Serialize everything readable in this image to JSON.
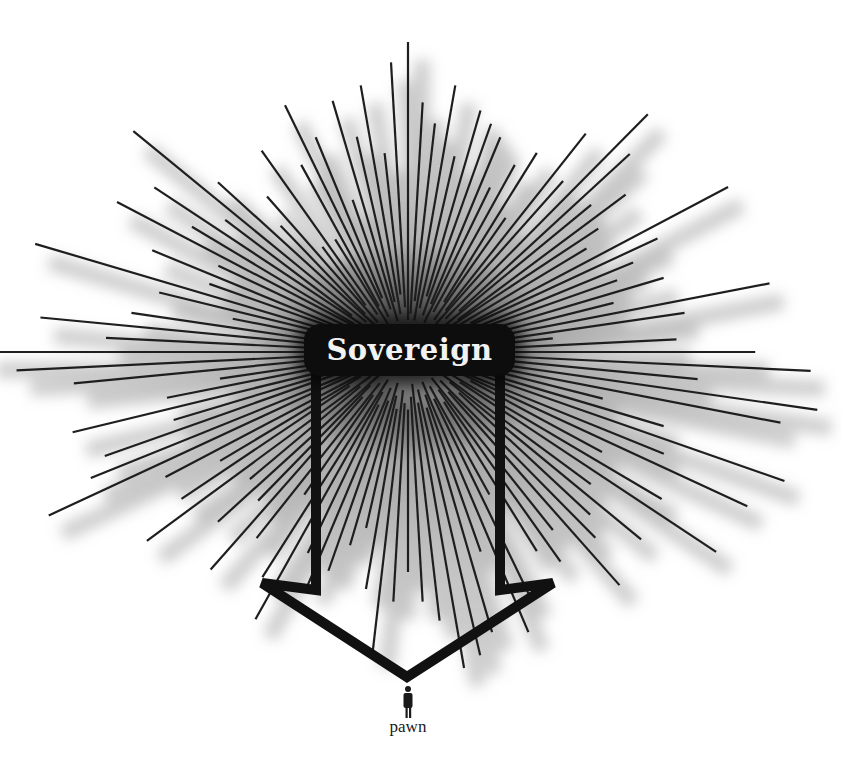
{
  "diagram": {
    "center": {
      "x": 408,
      "y": 352
    },
    "sovereign_label": "Sovereign",
    "pawn_label": "pawn",
    "colors": {
      "background": "#ffffff",
      "ray": "#1e1e1e",
      "ray_shadow": "#9a9a9a",
      "box": "#0d0d0d",
      "box_text": "#f2f2f2",
      "arrow": "#111111",
      "pawn": "#1a1a1a"
    },
    "arrow_path": [
      [
        316,
        372
      ],
      [
        316,
        590
      ],
      [
        262,
        583
      ],
      [
        407,
        677
      ],
      [
        553,
        583
      ],
      [
        500,
        590
      ],
      [
        500,
        372
      ]
    ],
    "pawn_figure": {
      "x": 408,
      "y": 686
    },
    "rays": [
      [
        -90,
        310
      ],
      [
        -87,
        250
      ],
      [
        -93,
        290
      ],
      [
        -84,
        230
      ],
      [
        -96,
        200
      ],
      [
        -81,
        270
      ],
      [
        -99,
        270
      ],
      [
        -78,
        200
      ],
      [
        -102,
        220
      ],
      [
        -75,
        250
      ],
      [
        -105,
        260
      ],
      [
        -72,
        240
      ],
      [
        -108,
        160
      ],
      [
        -69,
        230
      ],
      [
        -111,
        230
      ],
      [
        -66,
        180
      ],
      [
        -114,
        270
      ],
      [
        -63,
        210
      ],
      [
        -117,
        210
      ],
      [
        -60,
        230
      ],
      [
        -120,
        130
      ],
      [
        -57,
        160
      ],
      [
        -123,
        240
      ],
      [
        -54,
        270
      ],
      [
        -126,
        130
      ],
      [
        -51,
        220
      ],
      [
        -129,
        200
      ],
      [
        -48,
        320
      ],
      [
        -132,
        170
      ],
      [
        -45,
        280
      ],
      [
        -135,
        240
      ],
      [
        -42,
        220
      ],
      [
        -138,
        330
      ],
      [
        -39,
        250
      ],
      [
        -141,
        210
      ],
      [
        -36,
        210
      ],
      [
        -144,
        280
      ],
      [
        -33,
        190
      ],
      [
        -147,
        230
      ],
      [
        -30,
        330
      ],
      [
        -150,
        300
      ],
      [
        -27,
        250
      ],
      [
        -153,
        190
      ],
      [
        -24,
        220
      ],
      [
        -156,
        250
      ],
      [
        -21,
        200
      ],
      [
        -159,
        190
      ],
      [
        -18,
        240
      ],
      [
        -162,
        350
      ],
      [
        -15,
        190
      ],
      [
        -165,
        230
      ],
      [
        -12,
        330
      ],
      [
        -168,
        160
      ],
      [
        -9,
        250
      ],
      [
        -171,
        250
      ],
      [
        -6,
        130
      ],
      [
        -174,
        330
      ],
      [
        -3,
        240
      ],
      [
        -177,
        270
      ],
      [
        0,
        310
      ],
      [
        180,
        380
      ],
      [
        3,
        360
      ],
      [
        177,
        350
      ],
      [
        6,
        260
      ],
      [
        174,
        300
      ],
      [
        9,
        370
      ],
      [
        171,
        170
      ],
      [
        12,
        340
      ],
      [
        168,
        220
      ],
      [
        15,
        180
      ],
      [
        165,
        310
      ],
      [
        18,
        240
      ],
      [
        162,
        220
      ],
      [
        21,
        360
      ],
      [
        159,
        290
      ],
      [
        24,
        250
      ],
      [
        156,
        310
      ],
      [
        27,
        340
      ],
      [
        153,
        360
      ],
      [
        30,
        200
      ],
      [
        150,
        250
      ],
      [
        33,
        270
      ],
      [
        147,
        200
      ],
      [
        36,
        340
      ],
      [
        144,
        250
      ],
      [
        39,
        210
      ],
      [
        141,
        300
      ],
      [
        42,
        280
      ],
      [
        138,
        190
      ],
      [
        45,
        230
      ],
      [
        135,
        240
      ],
      [
        48,
        250
      ],
      [
        132,
        200
      ],
      [
        51,
        300
      ],
      [
        129,
        280
      ],
      [
        54,
        220
      ],
      [
        126,
        230
      ],
      [
        57,
        250
      ],
      [
        123,
        170
      ],
      [
        60,
        230
      ],
      [
        120,
        260
      ],
      [
        63,
        160
      ],
      [
        117,
        300
      ],
      [
        66,
        270
      ],
      [
        114,
        220
      ],
      [
        69,
        300
      ],
      [
        111,
        250
      ],
      [
        72,
        210
      ],
      [
        108,
        230
      ],
      [
        75,
        290
      ],
      [
        105,
        200
      ],
      [
        78,
        310
      ],
      [
        102,
        180
      ],
      [
        81,
        320
      ],
      [
        99,
        240
      ],
      [
        84,
        270
      ],
      [
        96,
        300
      ],
      [
        87,
        250
      ],
      [
        93,
        250
      ],
      [
        90,
        220
      ]
    ]
  }
}
